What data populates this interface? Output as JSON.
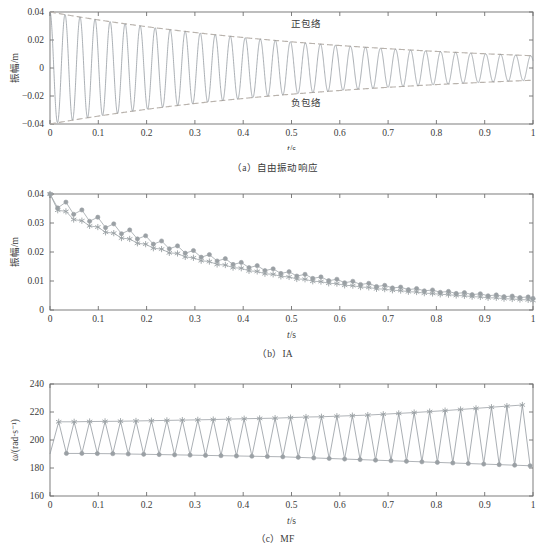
{
  "figure": {
    "panels": [
      {
        "id": "a",
        "caption": "（a）自由振动响应",
        "xlabel": "t/s",
        "ylabel": "振幅/m",
        "annotations": [
          {
            "name": "positive-envelope-label",
            "text": "正包络"
          },
          {
            "name": "negative-envelope-label",
            "text": "负包络"
          }
        ]
      },
      {
        "id": "b",
        "caption": "（b）IA",
        "xlabel": "t/s",
        "ylabel": "振幅/m"
      },
      {
        "id": "c",
        "caption": "（c）MF",
        "xlabel": "t/s",
        "ylabel": "ω/(rad·s⁻¹)"
      }
    ]
  },
  "colors": {
    "signal": "#8d949b",
    "envelope": "#b9b3ad",
    "series_circle": "#9aa0a4",
    "series_star": "#9aa0a4",
    "axis": "#6f6f6f",
    "text": "#3a3a3a",
    "background": "#ffffff"
  },
  "chart_data": [
    {
      "type": "line",
      "id": "a",
      "title": "（a）自由振动响应",
      "xlabel": "t/s",
      "ylabel": "振幅/m",
      "xlim": [
        0,
        1
      ],
      "ylim": [
        -0.04,
        0.04
      ],
      "xticks": [
        0,
        0.1,
        0.2,
        0.3,
        0.4,
        0.5,
        0.6,
        0.7,
        0.8,
        0.9,
        1
      ],
      "xticklabels": [
        "0",
        "0.1",
        "0.2",
        "0.3",
        "0.4",
        "0.5",
        "0.6",
        "0.7",
        "0.8",
        "0.9",
        "1"
      ],
      "yticks": [
        -0.04,
        -0.02,
        0,
        0.02,
        0.04
      ],
      "yticklabels": [
        "−0.04",
        "−0.02",
        "0",
        "0.02",
        "0.04"
      ],
      "grid": false,
      "legend": "none",
      "annotations": [
        {
          "text": "正包络",
          "x": 0.53,
          "y": 0.029
        },
        {
          "text": "负包络",
          "x": 0.53,
          "y": -0.027
        }
      ],
      "model": {
        "description": "Damped free vibration x(t)=A0*exp(-zeta*wn*t)*cos(wd*t+phi) with envelopes +/-A0*exp(-zeta*wn*t)",
        "A0": 0.04,
        "decay_rate_per_s": 1.52,
        "angular_frequency_rad_s": 202.0,
        "phase_rad": 0.0,
        "n_cycles_over_1s": 32
      },
      "series": [
        {
          "name": "自由振动响应",
          "style": "solid",
          "color": "#8d949b"
        },
        {
          "name": "正包络",
          "style": "dashed",
          "color": "#b9b3ad"
        },
        {
          "name": "负包络",
          "style": "dashed",
          "color": "#b9b3ad"
        }
      ],
      "envelope_samples": {
        "t": [
          0,
          0.1,
          0.2,
          0.3,
          0.4,
          0.5,
          0.6,
          0.7,
          0.8,
          0.9,
          1.0
        ],
        "positive": [
          0.04,
          0.0344,
          0.0295,
          0.0254,
          0.0218,
          0.0187,
          0.0161,
          0.0138,
          0.0119,
          0.0102,
          0.0088
        ],
        "negative": [
          -0.04,
          -0.0344,
          -0.0295,
          -0.0254,
          -0.0218,
          -0.0187,
          -0.0161,
          -0.0138,
          -0.0119,
          -0.0102,
          -0.0088
        ]
      }
    },
    {
      "type": "line",
      "id": "b",
      "title": "（b）IA",
      "xlabel": "t/s",
      "ylabel": "振幅/m",
      "xlim": [
        0,
        1
      ],
      "ylim": [
        0,
        0.04
      ],
      "xticks": [
        0,
        0.1,
        0.2,
        0.3,
        0.4,
        0.5,
        0.6,
        0.7,
        0.8,
        0.9,
        1
      ],
      "xticklabels": [
        "0",
        "0.1",
        "0.2",
        "0.3",
        "0.4",
        "0.5",
        "0.6",
        "0.7",
        "0.8",
        "0.9",
        "1"
      ],
      "yticks": [
        0,
        0.01,
        0.02,
        0.03,
        0.04
      ],
      "yticklabels": [
        "0",
        "0.01",
        "0.02",
        "0.03",
        "0.04"
      ],
      "grid": false,
      "legend": "none",
      "x": [
        0.0,
        0.016,
        0.033,
        0.049,
        0.066,
        0.082,
        0.099,
        0.115,
        0.132,
        0.148,
        0.165,
        0.181,
        0.198,
        0.214,
        0.231,
        0.247,
        0.264,
        0.28,
        0.297,
        0.313,
        0.33,
        0.346,
        0.363,
        0.379,
        0.396,
        0.412,
        0.429,
        0.445,
        0.462,
        0.478,
        0.495,
        0.511,
        0.528,
        0.544,
        0.561,
        0.577,
        0.594,
        0.61,
        0.627,
        0.643,
        0.66,
        0.676,
        0.693,
        0.709,
        0.726,
        0.742,
        0.759,
        0.775,
        0.792,
        0.808,
        0.825,
        0.841,
        0.858,
        0.874,
        0.891,
        0.907,
        0.924,
        0.94,
        0.957,
        0.973,
        0.99,
        1.0
      ],
      "series": [
        {
          "name": "IA-upper (circles)",
          "marker": "circle",
          "color": "#9aa0a4",
          "values": [
            0.04,
            0.0352,
            0.0372,
            0.033,
            0.0345,
            0.0306,
            0.032,
            0.0284,
            0.0297,
            0.0263,
            0.0276,
            0.0245,
            0.0256,
            0.0227,
            0.0238,
            0.0211,
            0.0221,
            0.0196,
            0.0205,
            0.0182,
            0.0191,
            0.0169,
            0.0177,
            0.0157,
            0.0164,
            0.0146,
            0.0153,
            0.0136,
            0.0142,
            0.0126,
            0.0132,
            0.0117,
            0.0123,
            0.0109,
            0.0114,
            0.0101,
            0.0106,
            0.0094,
            0.0099,
            0.0088,
            0.0092,
            0.0081,
            0.0085,
            0.0076,
            0.0079,
            0.007,
            0.0074,
            0.0066,
            0.0069,
            0.0061,
            0.0064,
            0.0057,
            0.006,
            0.0053,
            0.0056,
            0.0049,
            0.0052,
            0.0046,
            0.0048,
            0.0043,
            0.0045,
            0.004
          ]
        },
        {
          "name": "IA-lower (stars)",
          "marker": "star",
          "color": "#9aa0a4",
          "values": [
            0.04,
            0.0344,
            0.034,
            0.0312,
            0.0308,
            0.029,
            0.0286,
            0.0268,
            0.0265,
            0.0248,
            0.0245,
            0.023,
            0.0227,
            0.0213,
            0.021,
            0.0197,
            0.0195,
            0.0183,
            0.018,
            0.017,
            0.0167,
            0.0157,
            0.0155,
            0.0146,
            0.0144,
            0.0135,
            0.0133,
            0.0125,
            0.0123,
            0.0116,
            0.0114,
            0.0107,
            0.0106,
            0.0099,
            0.0098,
            0.0092,
            0.0091,
            0.0085,
            0.0084,
            0.0079,
            0.0078,
            0.0073,
            0.0072,
            0.0068,
            0.0067,
            0.0063,
            0.0062,
            0.0058,
            0.0057,
            0.0054,
            0.0053,
            0.005,
            0.0049,
            0.0046,
            0.0045,
            0.0042,
            0.0042,
            0.0039,
            0.0038,
            0.0036,
            0.0035,
            0.0033
          ]
        }
      ]
    },
    {
      "type": "line",
      "id": "c",
      "title": "（c）MF",
      "xlabel": "t/s",
      "ylabel": "ω/(rad·s⁻¹)",
      "xlim": [
        0,
        1
      ],
      "ylim": [
        160,
        240
      ],
      "xticks": [
        0,
        0.1,
        0.2,
        0.3,
        0.4,
        0.5,
        0.6,
        0.7,
        0.8,
        0.9,
        1
      ],
      "xticklabels": [
        "0",
        "0.1",
        "0.2",
        "0.3",
        "0.4",
        "0.5",
        "0.6",
        "0.7",
        "0.8",
        "0.9",
        "1"
      ],
      "yticks": [
        160,
        180,
        200,
        220,
        240
      ],
      "yticklabels": [
        "160",
        "180",
        "200",
        "220",
        "240"
      ],
      "grid": false,
      "legend": "none",
      "start_value": 190.0,
      "peaks": {
        "name": "MF-peaks (stars)",
        "marker": "star",
        "color": "#9aa0a4",
        "t": [
          0.018,
          0.05,
          0.082,
          0.114,
          0.146,
          0.178,
          0.21,
          0.242,
          0.274,
          0.306,
          0.338,
          0.37,
          0.402,
          0.434,
          0.466,
          0.498,
          0.53,
          0.562,
          0.594,
          0.626,
          0.658,
          0.69,
          0.722,
          0.754,
          0.786,
          0.818,
          0.85,
          0.882,
          0.914,
          0.946,
          0.978
        ],
        "values": [
          213.0,
          213.0,
          213.2,
          213.3,
          213.4,
          213.6,
          213.8,
          214.0,
          214.2,
          214.4,
          214.6,
          214.9,
          215.2,
          215.4,
          215.6,
          216.0,
          216.4,
          216.6,
          217.0,
          217.4,
          217.8,
          218.4,
          219.0,
          219.6,
          220.3,
          221.0,
          221.8,
          222.6,
          223.4,
          224.2,
          225.0
        ]
      },
      "troughs": {
        "name": "MF-troughs (circles)",
        "marker": "circle",
        "color": "#9aa0a4",
        "t": [
          0.034,
          0.066,
          0.098,
          0.13,
          0.162,
          0.194,
          0.226,
          0.258,
          0.29,
          0.322,
          0.354,
          0.386,
          0.418,
          0.45,
          0.482,
          0.514,
          0.546,
          0.578,
          0.61,
          0.642,
          0.674,
          0.706,
          0.738,
          0.77,
          0.802,
          0.834,
          0.866,
          0.898,
          0.93,
          0.962,
          0.994
        ],
        "values": [
          190.4,
          190.4,
          190.3,
          190.2,
          190.0,
          189.8,
          189.6,
          189.4,
          189.2,
          189.0,
          188.8,
          188.6,
          188.4,
          188.2,
          188.0,
          187.6,
          187.2,
          186.8,
          186.4,
          186.0,
          185.6,
          185.2,
          184.8,
          184.4,
          184.0,
          183.6,
          183.2,
          182.8,
          182.4,
          182.0,
          181.6
        ]
      }
    }
  ]
}
